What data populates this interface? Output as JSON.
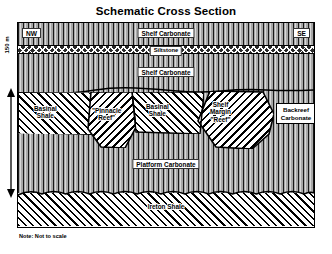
{
  "title": "Schematic Cross Section",
  "orientation": {
    "left": "NW",
    "right": "SE"
  },
  "scale": {
    "label": "150 m",
    "arrow": "double-headed-vertical-arrow"
  },
  "note": "Note: Not to scale",
  "layers": [
    {
      "id": "shelf_carbonate_upper",
      "label": "Shelf Carbonate",
      "pattern": "vertical-line-carbonate"
    },
    {
      "id": "siltstone",
      "label": "Siltstone",
      "pattern": "bowtie-cross"
    },
    {
      "id": "shelf_carbonate_lower",
      "label": "Shelf Carbonate",
      "pattern": "vertical-line-carbonate"
    },
    {
      "id": "platform_carbonate",
      "label": "Platform Carbonate",
      "pattern": "vertical-line-carbonate"
    },
    {
      "id": "ireton_shale",
      "label": "Ireton Shale",
      "pattern": "diagonal-hatch"
    }
  ],
  "bodies": [
    {
      "id": "basinal_shale_left",
      "label": "Basinal\nShale",
      "line1": "Basinal",
      "line2": "Shale",
      "pattern": "diagonal-hatch"
    },
    {
      "id": "pinnacle_reef",
      "label": "\"Pinnacle\nReef\"",
      "line1": "\"Pinnacle",
      "line2": "Reef\"",
      "pattern": "reverse-diagonal-hatch"
    },
    {
      "id": "basinal_shale_center",
      "label": "Basinal\nShale",
      "line1": "Basinal",
      "line2": "Shale",
      "pattern": "diagonal-hatch"
    },
    {
      "id": "shelf_margin_reef",
      "label": "Shelf Margin \"Reef\"",
      "line1": "Shelf",
      "line2": "Margin",
      "line3": "\"Reef\"",
      "pattern": "reverse-diagonal-hatch"
    },
    {
      "id": "backreef_carbonate",
      "label": "Backreef Carbonate",
      "line1": "Backreef",
      "line2": "Carbonate",
      "pattern": "white-label-box"
    }
  ],
  "colors": {
    "carbonate_grey": "#a8a8a8",
    "ink": "#000000",
    "paper": "#ffffff"
  }
}
